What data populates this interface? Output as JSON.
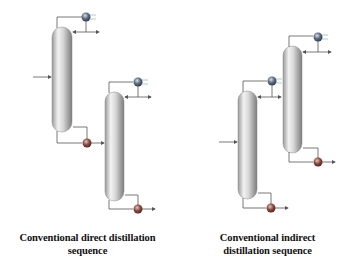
{
  "diagrams": [
    {
      "name": "direct",
      "caption_line1": "Conventional direct distillation",
      "caption_line2": "sequence"
    },
    {
      "name": "indirect",
      "caption_line1": "Conventional indirect",
      "caption_line2": "distillation sequence"
    }
  ],
  "colors": {
    "column_light": "#f4f4f4",
    "column_dark": "#8a8a8a",
    "condenser": "#4b5a6e",
    "reboiler": "#7a3f36",
    "line": "#555555"
  }
}
